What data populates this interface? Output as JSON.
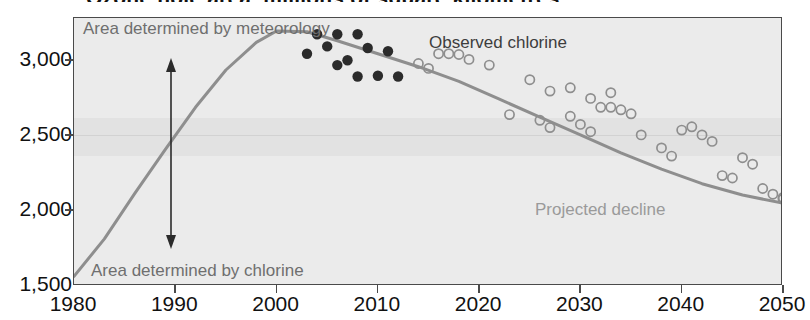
{
  "headline": "Ozone hole area, millions of square kilometres",
  "chart_data": {
    "type": "line",
    "title": "",
    "xlabel": "",
    "ylabel": "",
    "xlim": [
      1980,
      2050
    ],
    "ylim": [
      1500,
      3150
    ],
    "grid": true,
    "legend_position": "inline-annotations",
    "x_ticks": [
      "1980",
      "1990",
      "2000",
      "2010",
      "2020",
      "2030",
      "2040",
      "2050"
    ],
    "y_ticks": [
      "1,500",
      "2,000",
      "2,500",
      "3,000"
    ],
    "annotations": [
      {
        "text": "Area determined by meteorology",
        "x": 1981,
        "y": 3140,
        "color": "#6f6f6f"
      },
      {
        "text": "Observed chlorine",
        "x": 2012,
        "y": 3090,
        "color": "#3d3d3d"
      },
      {
        "text": "Projected decline",
        "x": 2028,
        "y": 2200,
        "color": "#8e8e8e"
      },
      {
        "text": "Area determined by chlorine",
        "x": 1981,
        "y": 1610,
        "color": "#6f6f6f"
      },
      {
        "text": "double-headed-arrow",
        "x": 1990,
        "y": 2400,
        "color": "#2b2b2b"
      }
    ],
    "series": [
      {
        "name": "Equivalent effective stratospheric chlorine trend",
        "type": "line",
        "color": "#8e8e8e",
        "points": [
          [
            1980,
            1560
          ],
          [
            1983,
            1790
          ],
          [
            1986,
            2070
          ],
          [
            1989,
            2340
          ],
          [
            1992,
            2600
          ],
          [
            1995,
            2830
          ],
          [
            1998,
            3000
          ],
          [
            2000,
            3070
          ],
          [
            2003,
            3065
          ],
          [
            2006,
            3010
          ],
          [
            2010,
            2930
          ],
          [
            2014,
            2850
          ],
          [
            2018,
            2760
          ],
          [
            2022,
            2650
          ],
          [
            2026,
            2540
          ],
          [
            2030,
            2430
          ],
          [
            2034,
            2320
          ],
          [
            2038,
            2220
          ],
          [
            2042,
            2130
          ],
          [
            2046,
            2060
          ],
          [
            2050,
            2010
          ]
        ]
      },
      {
        "name": "Observed chlorine",
        "type": "scatter",
        "marker": "filled-circle",
        "color": "#2b2b2b",
        "points": [
          [
            2004,
            3050
          ],
          [
            2006,
            3050
          ],
          [
            2008,
            3050
          ],
          [
            2003,
            2930
          ],
          [
            2005,
            2975
          ],
          [
            2007,
            2890
          ],
          [
            2009,
            2965
          ],
          [
            2006,
            2860
          ],
          [
            2008,
            2790
          ],
          [
            2011,
            2945
          ],
          [
            2010,
            2795
          ],
          [
            2012,
            2790
          ]
        ]
      },
      {
        "name": "Projected decline",
        "type": "scatter",
        "marker": "open-circle",
        "color": "#8e8e8e",
        "points": [
          [
            2014,
            2870
          ],
          [
            2016,
            2930
          ],
          [
            2017,
            2930
          ],
          [
            2018,
            2925
          ],
          [
            2019,
            2895
          ],
          [
            2015,
            2840
          ],
          [
            2021,
            2860
          ],
          [
            2025,
            2770
          ],
          [
            2027,
            2700
          ],
          [
            2029,
            2720
          ],
          [
            2023,
            2555
          ],
          [
            2026,
            2520
          ],
          [
            2027,
            2475
          ],
          [
            2029,
            2545
          ],
          [
            2030,
            2495
          ],
          [
            2031,
            2450
          ],
          [
            2032,
            2600
          ],
          [
            2033,
            2600
          ],
          [
            2034,
            2585
          ],
          [
            2035,
            2560
          ],
          [
            2031,
            2655
          ],
          [
            2033,
            2690
          ],
          [
            2036,
            2430
          ],
          [
            2038,
            2350
          ],
          [
            2039,
            2300
          ],
          [
            2040,
            2460
          ],
          [
            2041,
            2480
          ],
          [
            2042,
            2430
          ],
          [
            2043,
            2390
          ],
          [
            2044,
            2180
          ],
          [
            2045,
            2165
          ],
          [
            2046,
            2290
          ],
          [
            2047,
            2250
          ],
          [
            2048,
            2100
          ],
          [
            2049,
            2065
          ],
          [
            2050,
            2045
          ],
          [
            2050,
            2035
          ]
        ]
      }
    ]
  }
}
